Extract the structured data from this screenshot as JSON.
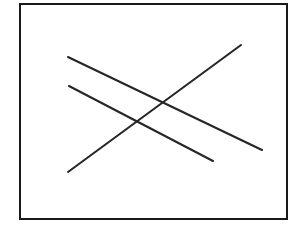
{
  "figure": {
    "canvas": {
      "width": 302,
      "height": 228,
      "background_color": "#ffffff"
    },
    "frame": {
      "name": "rectangular-border",
      "x": 20,
      "y": 4,
      "width": 267,
      "height": 215,
      "stroke_color": "#1a1a1a",
      "stroke_width": 2,
      "fill_color": "#ffffff"
    },
    "intersection": {
      "label": "common crossing point",
      "x": 148,
      "y": 112
    },
    "lines": [
      {
        "id": "line-upper-descending",
        "label": "Long line from upper-left to lower-right",
        "x1": 68,
        "y1": 57,
        "x2": 262,
        "y2": 150,
        "stroke_color": "#262626",
        "stroke_width": 2.1
      },
      {
        "id": "line-middle-descending",
        "label": "Short line from left to lower-right",
        "x1": 69,
        "y1": 86,
        "x2": 213,
        "y2": 161,
        "stroke_color": "#262626",
        "stroke_width": 2.1
      },
      {
        "id": "line-ascending",
        "label": "Line from lower-left to upper-right",
        "x1": 68,
        "y1": 172,
        "x2": 241,
        "y2": 45,
        "stroke_color": "#262626",
        "stroke_width": 2.1
      }
    ]
  },
  "chart_data": {
    "type": "line",
    "xlabel": "",
    "ylabel": "",
    "xlim": [
      20,
      287
    ],
    "ylim": [
      4,
      219
    ],
    "grid": false,
    "legend": "none",
    "series": [
      {
        "name": "line-upper-descending",
        "x": [
          68,
          262
        ],
        "y": [
          57,
          150
        ]
      },
      {
        "name": "line-middle-descending",
        "x": [
          69,
          213
        ],
        "y": [
          86,
          161
        ]
      },
      {
        "name": "line-ascending",
        "x": [
          68,
          241
        ],
        "y": [
          172,
          45
        ]
      }
    ],
    "annotations": [
      {
        "text": "common crossing point",
        "x": 148,
        "y": 112
      }
    ]
  }
}
